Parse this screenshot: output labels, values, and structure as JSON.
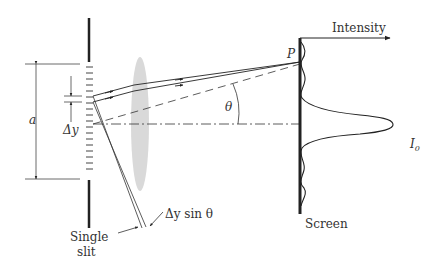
{
  "diagram": {
    "labels": {
      "intensity": "Intensity",
      "point_p": "P",
      "theta": "θ",
      "a": "a",
      "delta_y": "Δy",
      "path_diff": "Δy sin θ",
      "i0": "I",
      "i0_sub": "0",
      "screen": "Screen",
      "slit_line1": "Single",
      "slit_line2": "slit"
    },
    "colors": {
      "ink": "#222222",
      "lens": "#d9d9d9",
      "text": "#333333"
    }
  }
}
